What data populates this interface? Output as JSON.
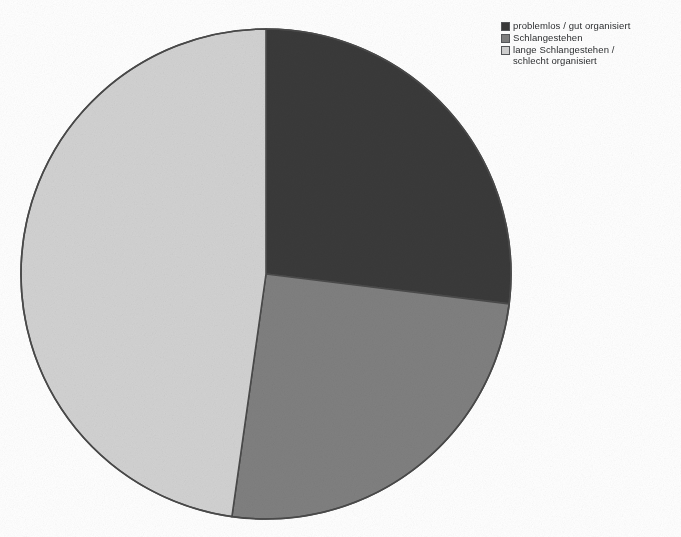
{
  "page": {
    "background_color": "#ffffff",
    "width": 681,
    "height": 537,
    "ghost_header_text": " "
  },
  "legend": {
    "position": "top-right",
    "items": [
      {
        "label": "problemlos / gut organisiert",
        "color": "#3a3a3a",
        "swatch_name": "legend-swatch-dark"
      },
      {
        "label": "Schlangestehen",
        "color": "#808080",
        "swatch_name": "legend-swatch-medium"
      },
      {
        "label": "lange Schlangestehen /\nschlecht organisiert",
        "color": "#d2d2d2",
        "swatch_name": "legend-swatch-light"
      }
    ]
  },
  "chart_data": {
    "type": "pie",
    "title": "",
    "subtitle": "",
    "xlabel": "",
    "ylabel": "",
    "grid": false,
    "legend_position": "top-right",
    "start_angle_deg": 0,
    "direction": "clockwise",
    "center_px": [
      266,
      274
    ],
    "radius_px": 246,
    "outline_color": "#4a4a4a",
    "labels": [
      "problemlos / gut organisiert",
      "Schlangestehen",
      "lange Schlangestehen / schlecht organisiert"
    ],
    "values": [
      27,
      25,
      48
    ],
    "unit": "%",
    "slices": [
      {
        "label": "problemlos / gut organisiert",
        "value": 27,
        "color": "#3a3a3a",
        "start_angle_deg": 0,
        "end_angle_deg": 97
      },
      {
        "label": "Schlangestehen",
        "value": 25,
        "color": "#808080",
        "start_angle_deg": 97,
        "end_angle_deg": 188
      },
      {
        "label": "lange Schlangestehen / schlecht organisiert",
        "value": 48,
        "color": "#d2d2d2",
        "start_angle_deg": 188,
        "end_angle_deg": 360
      }
    ]
  }
}
